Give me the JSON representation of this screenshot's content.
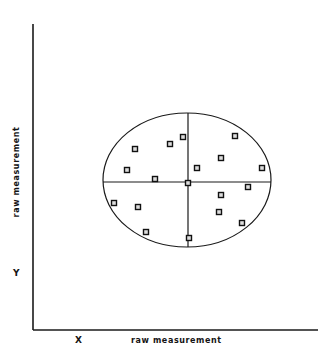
{
  "figure": {
    "background_color": "#ffffff",
    "line_color": "#1a1a1a",
    "marker_fill": "#dcdcdc",
    "marker_stroke": "#111111"
  },
  "axes": {
    "y_axis_label": "raw measurement",
    "x_axis_label": "raw measurement",
    "y_tick_label": "Y",
    "x_tick_label": "X",
    "x_axis": {
      "x1": 33,
      "y1": 330,
      "x2": 318,
      "y2": 330
    },
    "y_axis": {
      "x1": 33,
      "y1": 24,
      "x2": 33,
      "y2": 330
    }
  },
  "chart_data": {
    "type": "scatter",
    "title": "",
    "xlabel": "raw measurement",
    "ylabel": "raw measurement",
    "xlim": [
      0,
      100
    ],
    "ylim": [
      0,
      100
    ],
    "grid": false,
    "legend": null,
    "annotations": [
      {
        "name": "bounding-ellipse",
        "shape": "ellipse",
        "cx": 187,
        "cy": 180,
        "rx": 84,
        "ry": 67
      },
      {
        "name": "vertical-divider",
        "shape": "line",
        "x1": 188,
        "y1": 113,
        "x2": 188,
        "y2": 247
      },
      {
        "name": "horizontal-divider",
        "shape": "line",
        "x1": 103,
        "y1": 182,
        "x2": 271,
        "y2": 182
      }
    ],
    "marker": "square",
    "marker_size": 5,
    "points": [
      {
        "x": 135,
        "y": 149,
        "quadrant": "upper-left"
      },
      {
        "x": 127,
        "y": 170,
        "quadrant": "upper-left"
      },
      {
        "x": 170,
        "y": 144,
        "quadrant": "upper-left"
      },
      {
        "x": 183,
        "y": 137,
        "quadrant": "upper-left"
      },
      {
        "x": 155,
        "y": 179,
        "quadrant": "upper-left"
      },
      {
        "x": 235,
        "y": 136,
        "quadrant": "upper-right"
      },
      {
        "x": 221,
        "y": 158,
        "quadrant": "upper-right"
      },
      {
        "x": 197,
        "y": 168,
        "quadrant": "upper-right"
      },
      {
        "x": 262,
        "y": 168,
        "quadrant": "upper-right"
      },
      {
        "x": 114,
        "y": 203,
        "quadrant": "lower-left"
      },
      {
        "x": 138,
        "y": 207,
        "quadrant": "lower-left"
      },
      {
        "x": 146,
        "y": 232,
        "quadrant": "lower-left"
      },
      {
        "x": 188,
        "y": 183,
        "quadrant": "center"
      },
      {
        "x": 248,
        "y": 187,
        "quadrant": "lower-right"
      },
      {
        "x": 221,
        "y": 195,
        "quadrant": "lower-right"
      },
      {
        "x": 219,
        "y": 212,
        "quadrant": "lower-right"
      },
      {
        "x": 242,
        "y": 223,
        "quadrant": "lower-right"
      },
      {
        "x": 189,
        "y": 238,
        "quadrant": "lower-right"
      }
    ]
  }
}
